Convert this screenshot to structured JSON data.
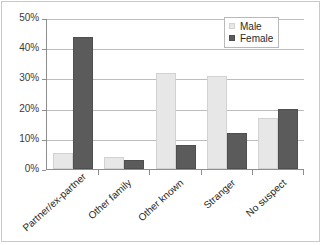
{
  "chart_data": {
    "type": "bar",
    "title": "",
    "subtitle": "",
    "xlabel": "",
    "ylabel": "",
    "ylim": [
      0,
      50
    ],
    "ytick_step": 10,
    "grid": true,
    "legend_position": "top-right",
    "value_suffix": "%",
    "categories": [
      "Partner/ex-partner",
      "Other family",
      "Other known",
      "Stranger",
      "No suspect"
    ],
    "ytick_labels": [
      "0%",
      "10%",
      "20%",
      "30%",
      "40%",
      "50%"
    ],
    "ytick_values": [
      0,
      10,
      20,
      30,
      40,
      50
    ],
    "series": [
      {
        "name": "Male",
        "color": "#e7e7e7",
        "values": [
          5.5,
          4,
          32,
          31,
          17
        ]
      },
      {
        "name": "Female",
        "color": "#5b5b5b",
        "values": [
          44,
          3,
          8,
          12,
          20
        ]
      }
    ]
  },
  "legend": {
    "entries": [
      {
        "label": "Male"
      },
      {
        "label": "Female"
      }
    ]
  }
}
